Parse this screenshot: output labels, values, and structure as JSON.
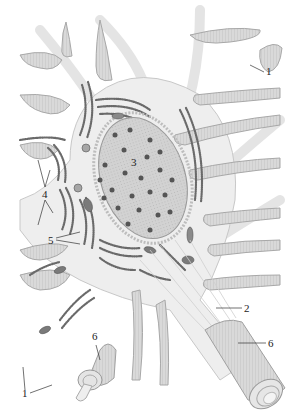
{
  "figure": {
    "palette": {
      "background": "#ffffff",
      "cytoplasm": "#ececec",
      "process_fill": "#d6d6d6",
      "process_edge": "#a8a8a8",
      "nucleus_fill": "#cfcfcf",
      "nucleus_dot": "#555555",
      "er_dots": "#6a6a6a",
      "mitochondria": "#777777",
      "myelin": "#cdcdcd",
      "label_text": "#222222"
    }
  },
  "labels": [
    {
      "id": "1",
      "text": "1",
      "x": 266,
      "y": 64
    },
    {
      "id": "1b",
      "text": "1",
      "x": 21,
      "y": 388
    },
    {
      "id": "2",
      "text": "2",
      "x": 244,
      "y": 313
    },
    {
      "id": "3",
      "text": "3",
      "x": 131,
      "y": 157
    },
    {
      "id": "4",
      "text": "4",
      "x": 42,
      "y": 194
    },
    {
      "id": "5",
      "text": "5",
      "x": 48,
      "y": 240
    },
    {
      "id": "6",
      "text": "6",
      "x": 91,
      "y": 333
    },
    {
      "id": "6b",
      "text": "6",
      "x": 268,
      "y": 347
    }
  ]
}
